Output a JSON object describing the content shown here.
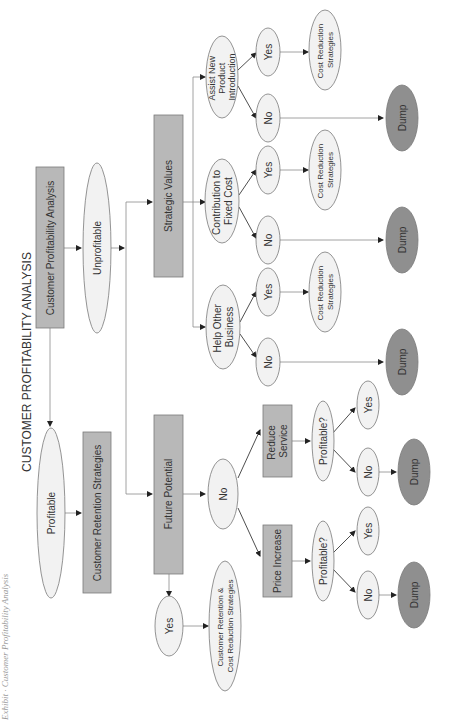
{
  "page": {
    "side_caption": "Exhibit · Customer Profitability Analysis",
    "title": "CUSTOMER PROFITABILITY ANALYSIS"
  },
  "colors": {
    "process_box": "#b8b8b8",
    "decision_ellipse": "#f2f2f2",
    "dump_ellipse": "#8f8f8f",
    "line": "#8a8a8a",
    "text": "#333333"
  },
  "nodes": {
    "root": "Customer Profitability Analysis",
    "profitable": "Profitable",
    "retention": "Customer Retention Strategies",
    "unprofitable": "Unprofitable",
    "strategic_values": "Strategic Values",
    "future_potential": "Future Potential",
    "fp_yes": "Yes",
    "fp_yes_result": [
      "Customer Retention &",
      "Cost Reduction Strategies"
    ],
    "fp_no": "No",
    "price_increase": "Price Increase",
    "reduce_service": [
      "Reduce",
      "Service"
    ],
    "pi_profitable": "Profitable?",
    "pi_no": "No",
    "pi_yes": "Yes",
    "pi_dump": "Dump",
    "rs_profitable": "Profitable?",
    "rs_no": "No",
    "rs_yes": "Yes",
    "rs_dump": "Dump",
    "help_other": [
      "Help Other",
      "Business"
    ],
    "help_no": "No",
    "help_yes": "Yes",
    "help_yes_result": [
      "Cost Reduction",
      "Strategies"
    ],
    "help_dump": "Dump",
    "contribution": [
      "Contribution to",
      "Fixed Cost"
    ],
    "contrib_no": "No",
    "contrib_yes": "Yes",
    "contrib_yes_result": [
      "Cost Reduction",
      "Strategies"
    ],
    "contrib_dump": "Dump",
    "assist": [
      "Assist New",
      "Product",
      "Introduction"
    ],
    "assist_no": "No",
    "assist_yes": "Yes",
    "assist_yes_result": [
      "Cost Reduction",
      "Strategies"
    ],
    "assist_dump": "Dump"
  }
}
